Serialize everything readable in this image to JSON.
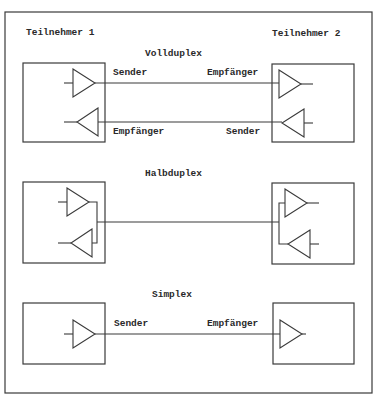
{
  "diagram": {
    "participants": {
      "left": "Teilnehmer 1",
      "right": "Teilnehmer 2"
    },
    "sections": [
      {
        "title": "Vollduplex",
        "links": [
          {
            "left_label": "Sender",
            "right_label": "Empfänger",
            "direction": "left-to-right"
          },
          {
            "left_label": "Empfänger",
            "right_label": "Sender",
            "direction": "right-to-left"
          }
        ]
      },
      {
        "title": "Halbduplex",
        "links": [
          {
            "direction": "bidirectional-shared-line"
          }
        ]
      },
      {
        "title": "Simplex",
        "links": [
          {
            "left_label": "Sender",
            "right_label": "Empfänger",
            "direction": "left-to-right"
          }
        ]
      }
    ],
    "colors": {
      "line": "#3a3a3a",
      "text": "#2a2a2a",
      "background": "#ffffff"
    }
  }
}
